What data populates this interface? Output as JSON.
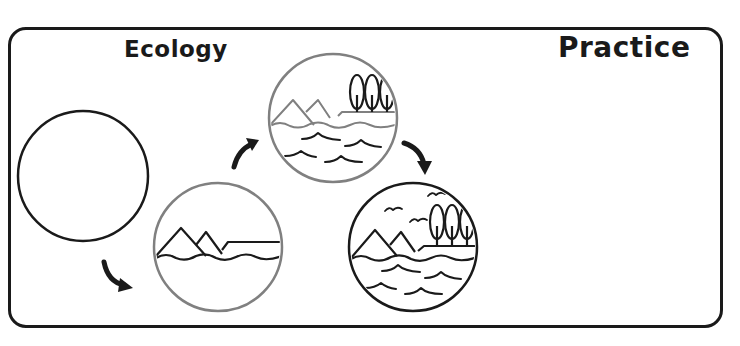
{
  "header": {
    "title_left": "Ecology",
    "title_right": "Practice"
  },
  "diagram": {
    "type": "ecological-succession-sequence",
    "stages": [
      {
        "index": 1,
        "label": "empty",
        "contents": []
      },
      {
        "index": 2,
        "label": "land-formation",
        "contents": [
          "mountains",
          "water-line"
        ]
      },
      {
        "index": 3,
        "label": "water-and-trees",
        "contents": [
          "mountains",
          "water",
          "waves",
          "trees"
        ]
      },
      {
        "index": 4,
        "label": "full-ecosystem",
        "contents": [
          "mountains",
          "water",
          "waves",
          "trees",
          "birds"
        ]
      }
    ],
    "arrows": [
      {
        "from": 1,
        "to": 2,
        "icon": "curved-arrow-down-right"
      },
      {
        "from": 2,
        "to": 3,
        "icon": "curved-arrow-up-right"
      },
      {
        "from": 3,
        "to": 4,
        "icon": "curved-arrow-down-right"
      }
    ],
    "colors": {
      "stroke_dark": "#1a1a1a",
      "stroke_gray": "#808080",
      "background": "#ffffff"
    }
  }
}
